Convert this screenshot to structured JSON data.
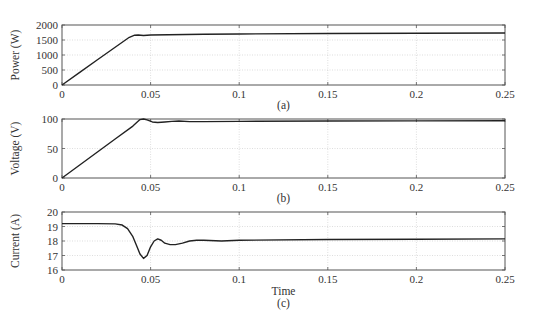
{
  "figure": {
    "panels": [
      {
        "id": "a",
        "caption": "(a)",
        "ylabel": "Power (W)",
        "xlabel": ""
      },
      {
        "id": "b",
        "caption": "(b)",
        "ylabel": "Voltage (V)",
        "xlabel": ""
      },
      {
        "id": "c",
        "caption": "(c)",
        "ylabel": "Current (A)",
        "xlabel": "Time"
      }
    ]
  },
  "chart_data": [
    {
      "type": "line",
      "title": "",
      "caption": "(a)",
      "xlabel": "",
      "ylabel": "Power (W)",
      "xlim": [
        0,
        0.25
      ],
      "ylim": [
        0,
        2000
      ],
      "xticks": [
        0,
        0.05,
        0.1,
        0.15,
        0.2,
        0.25
      ],
      "xtick_labels": [
        "0",
        "0.05",
        "0.1",
        "0.15",
        "0.2",
        "0.25"
      ],
      "yticks": [
        0,
        500,
        1000,
        1500,
        2000
      ],
      "ytick_labels": [
        "0",
        "500",
        "1000",
        "1500",
        "2000"
      ],
      "grid": true,
      "series": [
        {
          "name": "Power",
          "x": [
            0,
            0.01,
            0.02,
            0.03,
            0.038,
            0.041,
            0.043,
            0.046,
            0.05,
            0.06,
            0.08,
            0.1,
            0.15,
            0.2,
            0.25
          ],
          "y": [
            0,
            420,
            840,
            1260,
            1590,
            1660,
            1665,
            1650,
            1665,
            1675,
            1690,
            1700,
            1715,
            1725,
            1735
          ]
        }
      ]
    },
    {
      "type": "line",
      "title": "",
      "caption": "(b)",
      "xlabel": "",
      "ylabel": "Voltage (V)",
      "xlim": [
        0,
        0.25
      ],
      "ylim": [
        0,
        100
      ],
      "xticks": [
        0,
        0.05,
        0.1,
        0.15,
        0.2,
        0.25
      ],
      "xtick_labels": [
        "0",
        "0.05",
        "0.1",
        "0.15",
        "0.2",
        "0.25"
      ],
      "yticks": [
        0,
        50,
        100
      ],
      "ytick_labels": [
        "0",
        "50",
        "100"
      ],
      "grid": true,
      "series": [
        {
          "name": "Voltage",
          "x": [
            0,
            0.01,
            0.02,
            0.03,
            0.04,
            0.044,
            0.046,
            0.048,
            0.051,
            0.054,
            0.058,
            0.062,
            0.066,
            0.072,
            0.08,
            0.1,
            0.15,
            0.2,
            0.25
          ],
          "y": [
            0,
            22,
            44,
            66,
            88,
            99,
            100,
            98.5,
            95,
            94,
            95,
            96,
            96.5,
            95.5,
            95.5,
            96,
            96.5,
            96.8,
            97
          ]
        }
      ]
    },
    {
      "type": "line",
      "title": "",
      "caption": "(c)",
      "xlabel": "Time",
      "ylabel": "Current (A)",
      "xlim": [
        0,
        0.25
      ],
      "ylim": [
        16,
        20
      ],
      "xticks": [
        0,
        0.05,
        0.1,
        0.15,
        0.2,
        0.25
      ],
      "xtick_labels": [
        "0",
        "0.05",
        "0.1",
        "0.15",
        "0.2",
        "0.25"
      ],
      "yticks": [
        16,
        17,
        18,
        19,
        20
      ],
      "ytick_labels": [
        "16",
        "17",
        "18",
        "19",
        "20"
      ],
      "grid": true,
      "series": [
        {
          "name": "Current",
          "x": [
            0,
            0.01,
            0.02,
            0.03,
            0.034,
            0.037,
            0.04,
            0.042,
            0.044,
            0.046,
            0.048,
            0.05,
            0.052,
            0.054,
            0.056,
            0.058,
            0.061,
            0.064,
            0.068,
            0.072,
            0.076,
            0.08,
            0.09,
            0.1,
            0.15,
            0.2,
            0.25
          ],
          "y": [
            19.2,
            19.2,
            19.2,
            19.18,
            19.1,
            18.85,
            18.3,
            17.7,
            17.1,
            16.8,
            17.0,
            17.6,
            18.0,
            18.15,
            18.05,
            17.85,
            17.75,
            17.75,
            17.85,
            18.0,
            18.05,
            18.05,
            18.0,
            18.05,
            18.1,
            18.12,
            18.15
          ]
        }
      ]
    }
  ]
}
